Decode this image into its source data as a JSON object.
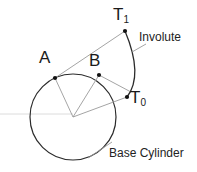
{
  "diagram": {
    "background_color": "#ffffff",
    "stroke_color": "#1a1a1a",
    "light_stroke_color": "#7a7a7a",
    "faint_stroke_color": "#d8d8d8",
    "labels": {
      "point_t1": "T",
      "point_t1_sub": "1",
      "point_t0": "T",
      "point_t0_sub": "0",
      "point_a": "A",
      "point_b": "B",
      "involute": "Involute",
      "base_cylinder": "Base Cylinder"
    },
    "geometry": {
      "circle_center_x": 73,
      "circle_center_y": 117,
      "circle_radius": 43,
      "point_a_x": 55,
      "point_a_y": 78,
      "point_b_x": 99,
      "point_b_y": 75,
      "point_t0_x": 127,
      "point_t0_y": 97,
      "point_t1_x": 125,
      "point_t1_y": 31
    }
  }
}
